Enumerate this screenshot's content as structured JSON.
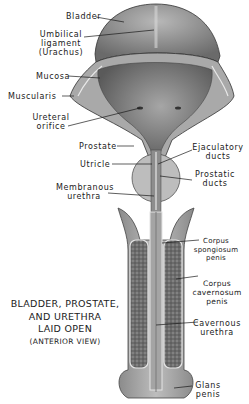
{
  "diagram": {
    "title_lines": [
      "BLADDER, PROSTATE,",
      "AND URETHRA",
      "LAID OPEN",
      "(ANTERIOR VIEW)"
    ],
    "labels_left": {
      "bladder": "Bladder",
      "umbilical_ligament": [
        "Umbilical",
        "ligament",
        "(Urachus)"
      ],
      "mucosa": "Mucosa",
      "muscularis": "Muscularis",
      "ureteral_orifice": [
        "Ureteral",
        "orifice"
      ],
      "prostate": "Prostate",
      "utricle": "Utricle",
      "membranous_urethra": [
        "Membranous",
        "urethra"
      ]
    },
    "labels_right": {
      "ejaculatory_ducts": [
        "Ejaculatory",
        "ducts"
      ],
      "prostatic_ducts": [
        "Prostatic",
        "ducts"
      ],
      "corpus_spongiosum": [
        "Corpus",
        "spongiosum",
        "penis"
      ],
      "corpus_cavernosum": [
        "Corpus",
        "cavernosum",
        "penis"
      ],
      "cavernous_urethra": [
        "Cavernous",
        "urethra"
      ],
      "glans_penis": [
        "Glans",
        "penis"
      ]
    },
    "colors": {
      "background": "#ffffff",
      "tissue_dark": "#6f6f6f",
      "tissue_mid": "#9a9a9a",
      "tissue_light": "#c9c9c9",
      "line": "#1a1a1a"
    }
  }
}
